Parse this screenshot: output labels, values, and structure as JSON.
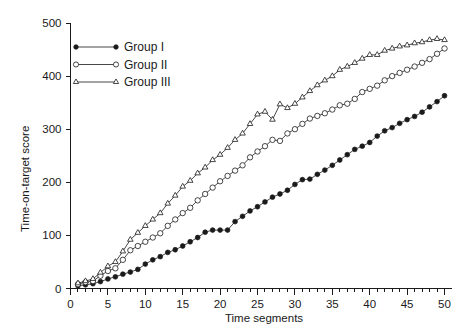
{
  "chart_data": {
    "type": "line",
    "title": "",
    "xlabel": "Time segments",
    "ylabel": "Time-on-target score",
    "xlim": [
      0,
      51
    ],
    "ylim": [
      0,
      500
    ],
    "grid": false,
    "legend_position": "top-left",
    "x_ticks_major": [
      0,
      5,
      10,
      15,
      20,
      25,
      30,
      35,
      40,
      45,
      50
    ],
    "x_tick_labels": [
      "0",
      "5",
      "10",
      "15",
      "20",
      "25",
      "30",
      "35",
      "40",
      "45",
      "50"
    ],
    "x_ticks_minor_step": 1,
    "y_ticks": [
      0,
      100,
      200,
      300,
      400,
      500
    ],
    "y_tick_labels": [
      "0",
      "100",
      "200",
      "300",
      "400",
      "500"
    ],
    "x": [
      1,
      2,
      3,
      4,
      5,
      6,
      7,
      8,
      9,
      10,
      11,
      12,
      13,
      14,
      15,
      16,
      17,
      18,
      19,
      20,
      21,
      22,
      23,
      24,
      25,
      26,
      27,
      28,
      29,
      30,
      31,
      32,
      33,
      34,
      35,
      36,
      37,
      38,
      39,
      40,
      41,
      42,
      43,
      44,
      45,
      46,
      47,
      48,
      49,
      50
    ],
    "series": [
      {
        "name": "Group I",
        "marker": "filled-circle",
        "values": [
          5,
          7,
          9,
          13,
          18,
          22,
          27,
          31,
          36,
          46,
          54,
          60,
          68,
          73,
          80,
          88,
          96,
          106,
          110,
          110,
          110,
          126,
          136,
          146,
          154,
          163,
          172,
          178,
          185,
          196,
          205,
          206,
          215,
          223,
          232,
          242,
          252,
          262,
          268,
          275,
          287,
          297,
          303,
          311,
          318,
          324,
          332,
          342,
          352,
          363
        ]
      },
      {
        "name": "Group II",
        "marker": "open-circle",
        "values": [
          8,
          12,
          14,
          24,
          33,
          38,
          54,
          72,
          80,
          88,
          96,
          104,
          118,
          130,
          142,
          152,
          166,
          178,
          190,
          202,
          212,
          222,
          232,
          247,
          258,
          268,
          280,
          278,
          292,
          300,
          310,
          320,
          325,
          330,
          337,
          345,
          348,
          357,
          370,
          376,
          382,
          392,
          400,
          406,
          412,
          418,
          425,
          432,
          442,
          452
        ]
      },
      {
        "name": "Group III",
        "marker": "open-triangle",
        "values": [
          10,
          14,
          18,
          30,
          42,
          50,
          70,
          92,
          105,
          118,
          130,
          142,
          160,
          175,
          192,
          203,
          217,
          228,
          242,
          252,
          265,
          280,
          292,
          310,
          328,
          333,
          318,
          347,
          340,
          348,
          360,
          372,
          383,
          392,
          400,
          412,
          418,
          425,
          433,
          440,
          440,
          448,
          452,
          456,
          458,
          462,
          464,
          468,
          470,
          468
        ]
      }
    ],
    "legend": [
      {
        "label": "Group I",
        "marker": "filled-circle"
      },
      {
        "label": "Group II",
        "marker": "open-circle"
      },
      {
        "label": "Group III",
        "marker": "open-triangle"
      }
    ]
  }
}
